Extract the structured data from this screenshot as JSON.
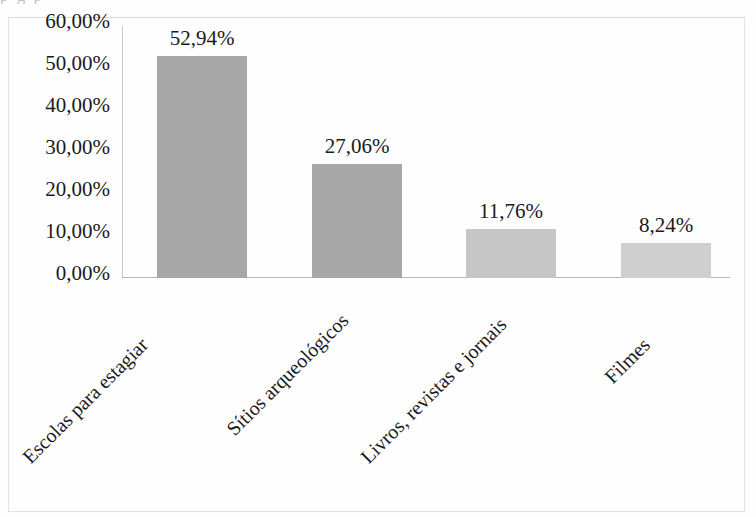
{
  "figure": {
    "cut_off_top_text": "p            g        p",
    "background_color": "#fefefe",
    "frame_color": "#e2e2e2",
    "axis_color": "#b5b5b5"
  },
  "chart_data": {
    "type": "bar",
    "title": "",
    "xlabel": "",
    "ylabel": "",
    "categories": [
      "Escolas para estagiar",
      "Sítios arqueológicos",
      "Livros, revistas e jornais",
      "Filmes"
    ],
    "values": [
      52.94,
      27.06,
      11.76,
      8.24
    ],
    "value_labels": [
      "52,94%",
      "27,06%",
      "11,76%",
      "8,24%"
    ],
    "bar_colors": [
      "#a7a7a7",
      "#a7a7a7",
      "#c6c6c6",
      "#cfcfcf"
    ],
    "ylim": [
      0,
      60
    ],
    "ytick_labels": [
      "60,00%",
      "50,00%",
      "40,00%",
      "30,00%",
      "20,00%",
      "10,00%",
      "0,00%"
    ],
    "ytick_values": [
      60,
      50,
      40,
      30,
      20,
      10,
      0
    ],
    "grid": false,
    "legend": false,
    "xtick_label_rotation": -45,
    "decimal_separator": ","
  }
}
